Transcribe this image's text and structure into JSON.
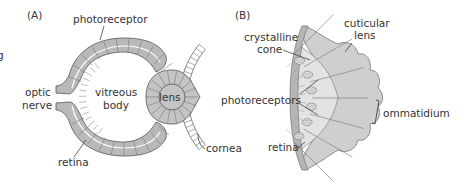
{
  "figure": {
    "clipped_left_text": "g",
    "panel_a": {
      "tag": "(A)",
      "labels": {
        "photoreceptor": "photoreceptor",
        "optic_nerve_line1": "optic",
        "optic_nerve_line2": "nerve",
        "vitreous_line1": "vitreous",
        "vitreous_line2": "body",
        "lens": "lens",
        "retina": "retina",
        "cornea": "cornea"
      }
    },
    "panel_b": {
      "tag": "(B)",
      "labels": {
        "crystalline_line1": "crystalline",
        "crystalline_line2": "cone",
        "cuticular_line1": "cuticular",
        "cuticular_line2": "lens",
        "photoreceptors": "photoreceptors",
        "ommatidium": "ommatidium",
        "retina": "retina"
      }
    },
    "colors": {
      "tissue_dark": "#b4b4b4",
      "tissue_mid": "#c8c8c8",
      "tissue_light": "#dcdcdc",
      "outline": "#555555",
      "text": "#333333"
    }
  }
}
